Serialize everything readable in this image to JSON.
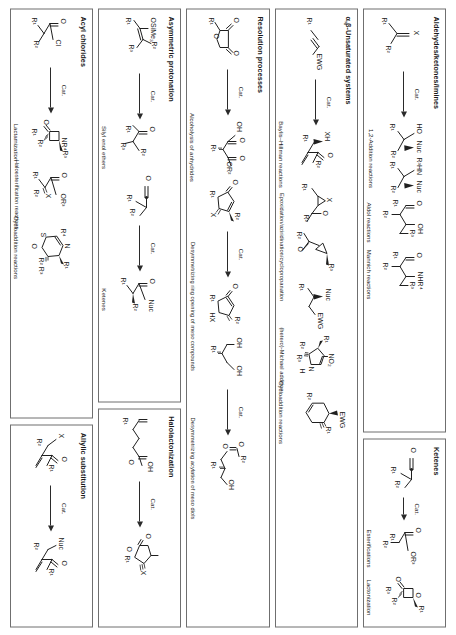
{
  "figure": {
    "orientation": "rotated-90",
    "ink": "#1f1f1f",
    "border": "#6f6f6f",
    "catalyst_label": "Cat."
  },
  "panels": [
    {
      "id": "aldehydes-ketones-imines",
      "title": "Aldehydes/ketones/imines",
      "captions": [
        "1,2-Addition reactions",
        "Aldol reactions",
        "Mannich reactions"
      ],
      "substrate_labels": [
        "X",
        "R¹",
        "R²"
      ],
      "product_labels": [
        "HO",
        "Nuc",
        "R³HN",
        "Nuc",
        "R¹",
        "R²",
        "O",
        "OH",
        "R¹",
        "R²",
        "R³",
        "O",
        "NHR⁴",
        "R¹",
        "R²",
        "R³"
      ]
    },
    {
      "id": "unsaturated-systems",
      "title": "α,β-Unsaturated systems",
      "captions": [
        "Baylis–Hillman reactions",
        "Epoxidation/aziridination/cyclopropanation",
        "(hetero)-Michael addition",
        "Cycloaddition reactions"
      ],
      "substrate_labels": [
        "R¹",
        "EWG"
      ],
      "product_labels": [
        "XH",
        "O",
        "R¹",
        "R²",
        "X",
        "O",
        "R¹",
        "R²",
        "R²",
        "O",
        "R³",
        "Nuc",
        "EWG",
        "R¹",
        "NO₂",
        "N",
        "H",
        "R¹",
        "R²",
        "R³",
        "EWG",
        "R¹",
        "R²"
      ]
    },
    {
      "id": "resolution-processes",
      "title": "Resolution processes",
      "captions": [
        "Alcoholysis of anhydrides",
        "Desymmetrizing ring opening of meso compounds",
        "Desymmetrizing acylation of meso diols"
      ],
      "substrate_labels": [
        "O",
        "O",
        "O",
        "R¹",
        "O",
        "R¹",
        "R²",
        "OH",
        "OH",
        "R¹"
      ],
      "product_labels": [
        "OH",
        "O",
        "O",
        "OR²",
        "R¹",
        "O",
        "R¹",
        "R²",
        "HX",
        "O",
        "R²",
        "O",
        "OH",
        "R¹"
      ]
    },
    {
      "id": "asymmetric-protonation",
      "title": "Asymmetric protonation",
      "captions": [
        "Silyl enol ethers",
        "Ketenes"
      ],
      "substrate_labels": [
        "OSiMe₃",
        "R¹",
        "R²",
        "R³",
        "O",
        "R¹",
        "R²"
      ],
      "product_labels": [
        "O",
        "R¹",
        "R²",
        "R³",
        "O",
        "Nuc",
        "R¹",
        "R²"
      ]
    },
    {
      "id": "acyl-chlorides",
      "title": "Acyl chlorides",
      "captions": [
        "Lactamization",
        "Haloesterification reactions",
        "Cycloaddition reactions"
      ],
      "substrate_labels": [
        "O",
        "Cl",
        "R¹",
        "R²"
      ],
      "product_labels": [
        "O",
        "NR⁴",
        "R¹",
        "R²",
        "R³",
        "O",
        "OR³",
        "X",
        "R¹",
        "R²",
        "R⁴",
        "N",
        "S",
        "O",
        "R¹",
        "R²",
        "R³"
      ]
    },
    {
      "id": "halolactonization",
      "title": "Halolactonization",
      "captions": [],
      "substrate_labels": [
        "R¹",
        "OH",
        "O"
      ],
      "product_labels": [
        "O",
        "O",
        "R¹",
        "X"
      ]
    },
    {
      "id": "allylic-substitution",
      "title": "Allylic substitution",
      "captions": [],
      "substrate_labels": [
        "X",
        "O",
        "R¹",
        "R²"
      ],
      "product_labels": [
        "Nuc",
        "O",
        "R¹",
        "R²"
      ]
    },
    {
      "id": "ketenes",
      "title": "Ketenes",
      "captions": [
        "Esterifications",
        "Lactonization"
      ],
      "substrate_labels": [
        "O",
        "R¹",
        "R²"
      ],
      "product_labels": [
        "O",
        "OR³",
        "R¹",
        "R²",
        "O",
        "O",
        "R¹",
        "R²",
        "R³"
      ]
    }
  ]
}
